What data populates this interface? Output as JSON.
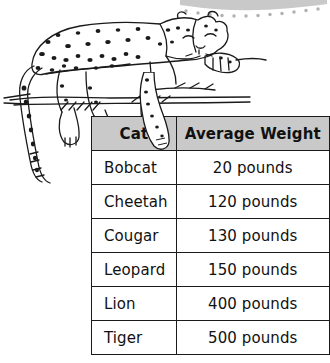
{
  "illustration": {
    "subject": "leopard-resting-on-branch",
    "description": "Black and white line drawing of a spotted leopard lying on a tree branch with its head resting on a front paw and a long tail hanging down"
  },
  "decoration": {
    "band": "gray-curved-band-with-dots",
    "band_color": "#c9c9c9",
    "dot_color": "#b0b0b0"
  },
  "table": {
    "headers": [
      "Cat",
      "Average Weight"
    ],
    "header_background": "#c9c9c9",
    "border_color": "#1a1a1a",
    "rows": [
      {
        "cat": "Bobcat",
        "weight": "20 pounds"
      },
      {
        "cat": "Cheetah",
        "weight": "120 pounds"
      },
      {
        "cat": "Cougar",
        "weight": "130 pounds"
      },
      {
        "cat": "Leopard",
        "weight": "150 pounds"
      },
      {
        "cat": "Lion",
        "weight": "400 pounds"
      },
      {
        "cat": "Tiger",
        "weight": "500 pounds"
      }
    ]
  }
}
